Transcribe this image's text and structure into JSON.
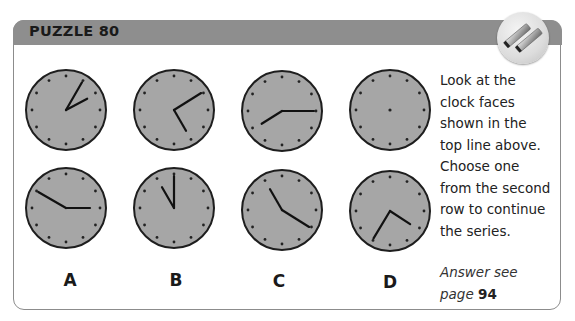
{
  "header": {
    "title": "PUZZLE 80",
    "badge_icon": "parallel-bars-icon",
    "bar_color": "#8e8e8e"
  },
  "clock_style": {
    "face_color": "#a6a6a6",
    "rim_color": "#1e1e1e",
    "hand_color": "#111111",
    "dot_color": "#222222"
  },
  "sequence": [
    {
      "id": "seq-1",
      "cx": 66,
      "cy": 110,
      "hands": [
        {
          "type": "long",
          "angle": 30
        },
        {
          "type": "short",
          "angle": 62
        }
      ],
      "center_dot": false
    },
    {
      "id": "seq-2",
      "cx": 174,
      "cy": 110,
      "hands": [
        {
          "type": "long",
          "angle": 58
        },
        {
          "type": "short",
          "angle": 150
        }
      ],
      "center_dot": false
    },
    {
      "id": "seq-3",
      "cx": 282,
      "cy": 111,
      "hands": [
        {
          "type": "long",
          "angle": 90
        },
        {
          "type": "short",
          "angle": 238
        }
      ],
      "center_dot": false
    },
    {
      "id": "seq-4",
      "cx": 390,
      "cy": 110,
      "hands": [],
      "center_dot": true
    }
  ],
  "options": [
    {
      "label": "A",
      "cx": 66,
      "cy": 208,
      "hands": [
        {
          "type": "long",
          "angle": 300
        },
        {
          "type": "short",
          "angle": 90
        }
      ]
    },
    {
      "label": "B",
      "cx": 174,
      "cy": 208,
      "hands": [
        {
          "type": "long",
          "angle": 0
        },
        {
          "type": "short",
          "angle": 330
        }
      ]
    },
    {
      "label": "C",
      "cx": 282,
      "cy": 210,
      "hands": [
        {
          "type": "long",
          "angle": 122
        },
        {
          "type": "short",
          "angle": 330
        }
      ]
    },
    {
      "label": "D",
      "cx": 390,
      "cy": 211,
      "hands": [
        {
          "type": "long",
          "angle": 211
        },
        {
          "type": "short",
          "angle": 123
        }
      ]
    }
  ],
  "instructions": {
    "lines": [
      "Look at the",
      "clock faces",
      "shown in the",
      "top line above.",
      "Choose one",
      "from the second",
      "row to continue",
      "the series."
    ]
  },
  "answer": {
    "prefix_line1": "Answer see",
    "prefix_line2": "page ",
    "page": "94"
  }
}
